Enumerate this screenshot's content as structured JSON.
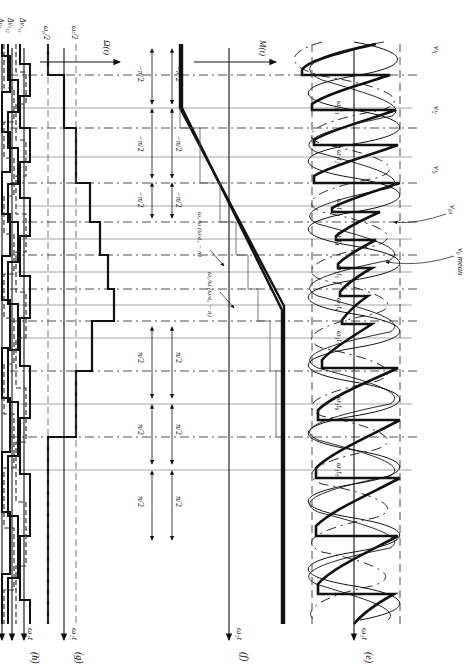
{
  "figure": {
    "title_note": "Modulation and switching waveform diagram",
    "panels": [
      {
        "id": "e",
        "tag": "(e)",
        "axis_label": "ω₁t",
        "kind": "three-phase sinusoids + reference"
      },
      {
        "id": "f",
        "tag": "(f)",
        "axis_label": "ω₁t",
        "vertical_label": "M(t)",
        "kind": "trapezoidal modulation function"
      },
      {
        "id": "g",
        "tag": "(g)",
        "axis_label": "ω₁t",
        "vertical_label": "Ω(t)",
        "kind": "stepped frequency command"
      },
      {
        "id": "h",
        "tag": "(h)",
        "axis_label": "ω₁t",
        "kind": "switching pulse trains"
      }
    ],
    "time_ticks": [
      "ω₁t₁",
      "ω₁t₂",
      "ω₁t₃",
      "ω₁t₄",
      "ω₁t₅",
      "ω₁t₆",
      "ω₁t₇",
      "ω₁t₈",
      "ω₁t₉"
    ],
    "panel_e_labels": [
      {
        "text": "vₗ₁"
      },
      {
        "text": "vₗ₂"
      },
      {
        "text": "vₗ₃"
      },
      {
        "text": "v₀ₐ"
      },
      {
        "text": "v₀ mean"
      }
    ],
    "panel_f_labels": {
      "axis": "M(t)",
      "positive_steps": [
        "π/2",
        "π/2",
        "π/2",
        "π/2"
      ],
      "negative_steps": [
        "−π/2",
        "−π/2",
        "−π/2",
        "−π/2"
      ],
      "slope_values": [
        "π/2",
        "π/2",
        "π/2",
        "π/2",
        "−π/2",
        "−π/2",
        "−π/2",
        "−π/2"
      ],
      "annotations": [
        {
          "text": "ω₀/ω (ωₕt₄ − π)"
        },
        {
          "text": "ω₀/ω (ωₕt₆ − π)"
        },
        {
          "text": "ω₀/ω (ωₕt₄ − π)"
        },
        {
          "text": "ω₀/ω (ωₕt₆ − π)"
        }
      ]
    },
    "panel_g_labels": {
      "axis": "Ω(t)",
      "levels": [
        "ω₀/2",
        "ωₜ/2"
      ]
    },
    "panel_h_labels": [
      "Δvₜ₁₁",
      "Δvₜ₁₂",
      "Δvₜ₁₃"
    ],
    "colors": {
      "ink": "#111111",
      "grid": "#8a8a8a",
      "dash": "#444444",
      "paper": "#ffffff"
    }
  }
}
